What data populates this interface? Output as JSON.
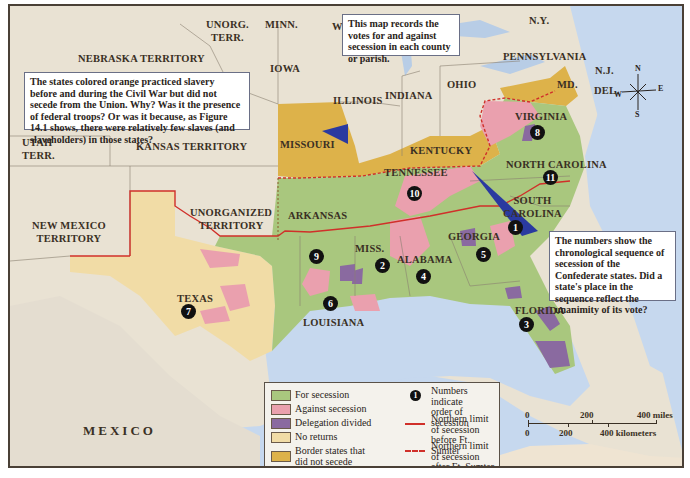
{
  "map": {
    "title": "Secession votes by county or parish",
    "colors": {
      "for_secession": "#a9c77e",
      "against_secession": "#eaa0ae",
      "delegation_divided": "#8a6aa0",
      "no_returns": "#f1dca6",
      "border_states": "#ddb24a",
      "ocean": "#c6d8ee",
      "land": "#e9e2d3",
      "limit_line": "#d0302a"
    },
    "region_labels": {
      "unorg_terr_1": "UNORG.",
      "unorg_terr_2": "TERR.",
      "minn": "MINN.",
      "wis": "WIS.",
      "michigan": "MICHIGAN",
      "ny": "N.Y.",
      "nebraska": "NEBRASKA TERRITORY",
      "iowa": "IOWA",
      "pennsylvania": "PENNSYLVANIA",
      "nj": "N.J.",
      "ohio": "OHIO",
      "md": "MD.",
      "del": "DEL.",
      "illinois": "ILLINOIS",
      "indiana": "INDIANA",
      "utah_1": "UTAH",
      "utah_2": "TERR.",
      "kansas": "KANSAS TERRITORY",
      "missouri": "MISSOURI",
      "virginia": "VIRGINIA",
      "kentucky": "KENTUCKY",
      "north_carolina": "NORTH CAROLINA",
      "tennessee": "TENNESSEE",
      "new_mexico_1": "NEW MEXICO",
      "new_mexico_2": "TERRITORY",
      "unorganized_1": "UNORGANIZED",
      "unorganized_2": "TERRITORY",
      "arkansas": "ARKANSAS",
      "south_carolina_1": "SOUTH",
      "south_carolina_2": "CAROLINA",
      "georgia": "GEORGIA",
      "miss": "MISS.",
      "alabama": "ALABAMA",
      "texas": "TEXAS",
      "louisiana": "LOUISIANA",
      "florida": "FLORIDA",
      "mexico": "MEXICO"
    },
    "secession_order": {
      "south_carolina": "1",
      "mississippi": "2",
      "florida": "3",
      "alabama": "4",
      "georgia": "5",
      "louisiana": "6",
      "texas": "7",
      "virginia": "8",
      "arkansas": "9",
      "tennessee": "10",
      "north_carolina": "11"
    },
    "callouts": {
      "votes_note": "This map records the votes for and against secession in each county or parish.",
      "border_states_note": "The states colored orange practiced slavery before and during the Civil War but did not secede from the Union. Why? Was it the presence of federal troops? Or was it because, as Figure 14.1 shows, there were relatively few slaves (and slaveholders) in those states?",
      "numbers_note": "The numbers show the chronological sequence of secession of the Confederate states. Did a state's place in the sequence reflect the unanimity of its vote?"
    },
    "legend": {
      "items": [
        {
          "label": "For secession",
          "swatch": "for_secession"
        },
        {
          "label": "Against secession",
          "swatch": "against_secession"
        },
        {
          "label": "Delegation divided",
          "swatch": "delegation_divided"
        },
        {
          "label": "No returns",
          "swatch": "no_returns"
        },
        {
          "label_1": "Border states that",
          "label_2": "did not secede",
          "swatch": "border_states"
        }
      ],
      "numbers_label_1": "Numbers indicate",
      "numbers_label_2": "order of secession",
      "numbers_symbol": "1",
      "solid_line_1": "Northern limit of secession",
      "solid_line_2": "before Ft. Sumter",
      "dashed_line_1": "Northern limit of secession",
      "dashed_line_2": "after Ft. Sumter"
    },
    "scale_bar": {
      "miles_ticks": [
        "0",
        "200",
        "400 miles"
      ],
      "km_ticks": [
        "0",
        "200",
        "400 kilometers"
      ]
    },
    "compass": {
      "n": "N",
      "s": "S",
      "e": "E",
      "w": "W"
    }
  }
}
